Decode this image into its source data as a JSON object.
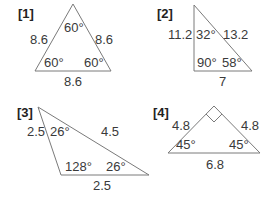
{
  "figures": [
    {
      "number": "[1]",
      "shape": "equilateral triangle",
      "sides": {
        "left": "8.6",
        "right": "8.6",
        "bottom": "8.6"
      },
      "angles": {
        "top": "60°",
        "bottom_left": "60°",
        "bottom_right": "60°"
      }
    },
    {
      "number": "[2]",
      "shape": "right triangle",
      "sides": {
        "left": "11.2",
        "hypotenuse": "13.2",
        "bottom": "7"
      },
      "angles": {
        "top": "32°",
        "bottom_left": "90°",
        "bottom_right": "58°"
      }
    },
    {
      "number": "[3]",
      "shape": "obtuse isosceles triangle",
      "sides": {
        "left": "2.5",
        "top": "4.5",
        "bottom": "2.5"
      },
      "angles": {
        "top": "26°",
        "bottom_left": "128°",
        "bottom_right": "26°"
      }
    },
    {
      "number": "[4]",
      "shape": "right isosceles triangle",
      "sides": {
        "left": "4.8",
        "right": "4.8",
        "bottom": "6.8"
      },
      "angles": {
        "top": "right-angle",
        "bottom_left": "45°",
        "bottom_right": "45°"
      }
    }
  ],
  "colors": {
    "stroke": "#777777",
    "text": "#3a3a3a"
  }
}
